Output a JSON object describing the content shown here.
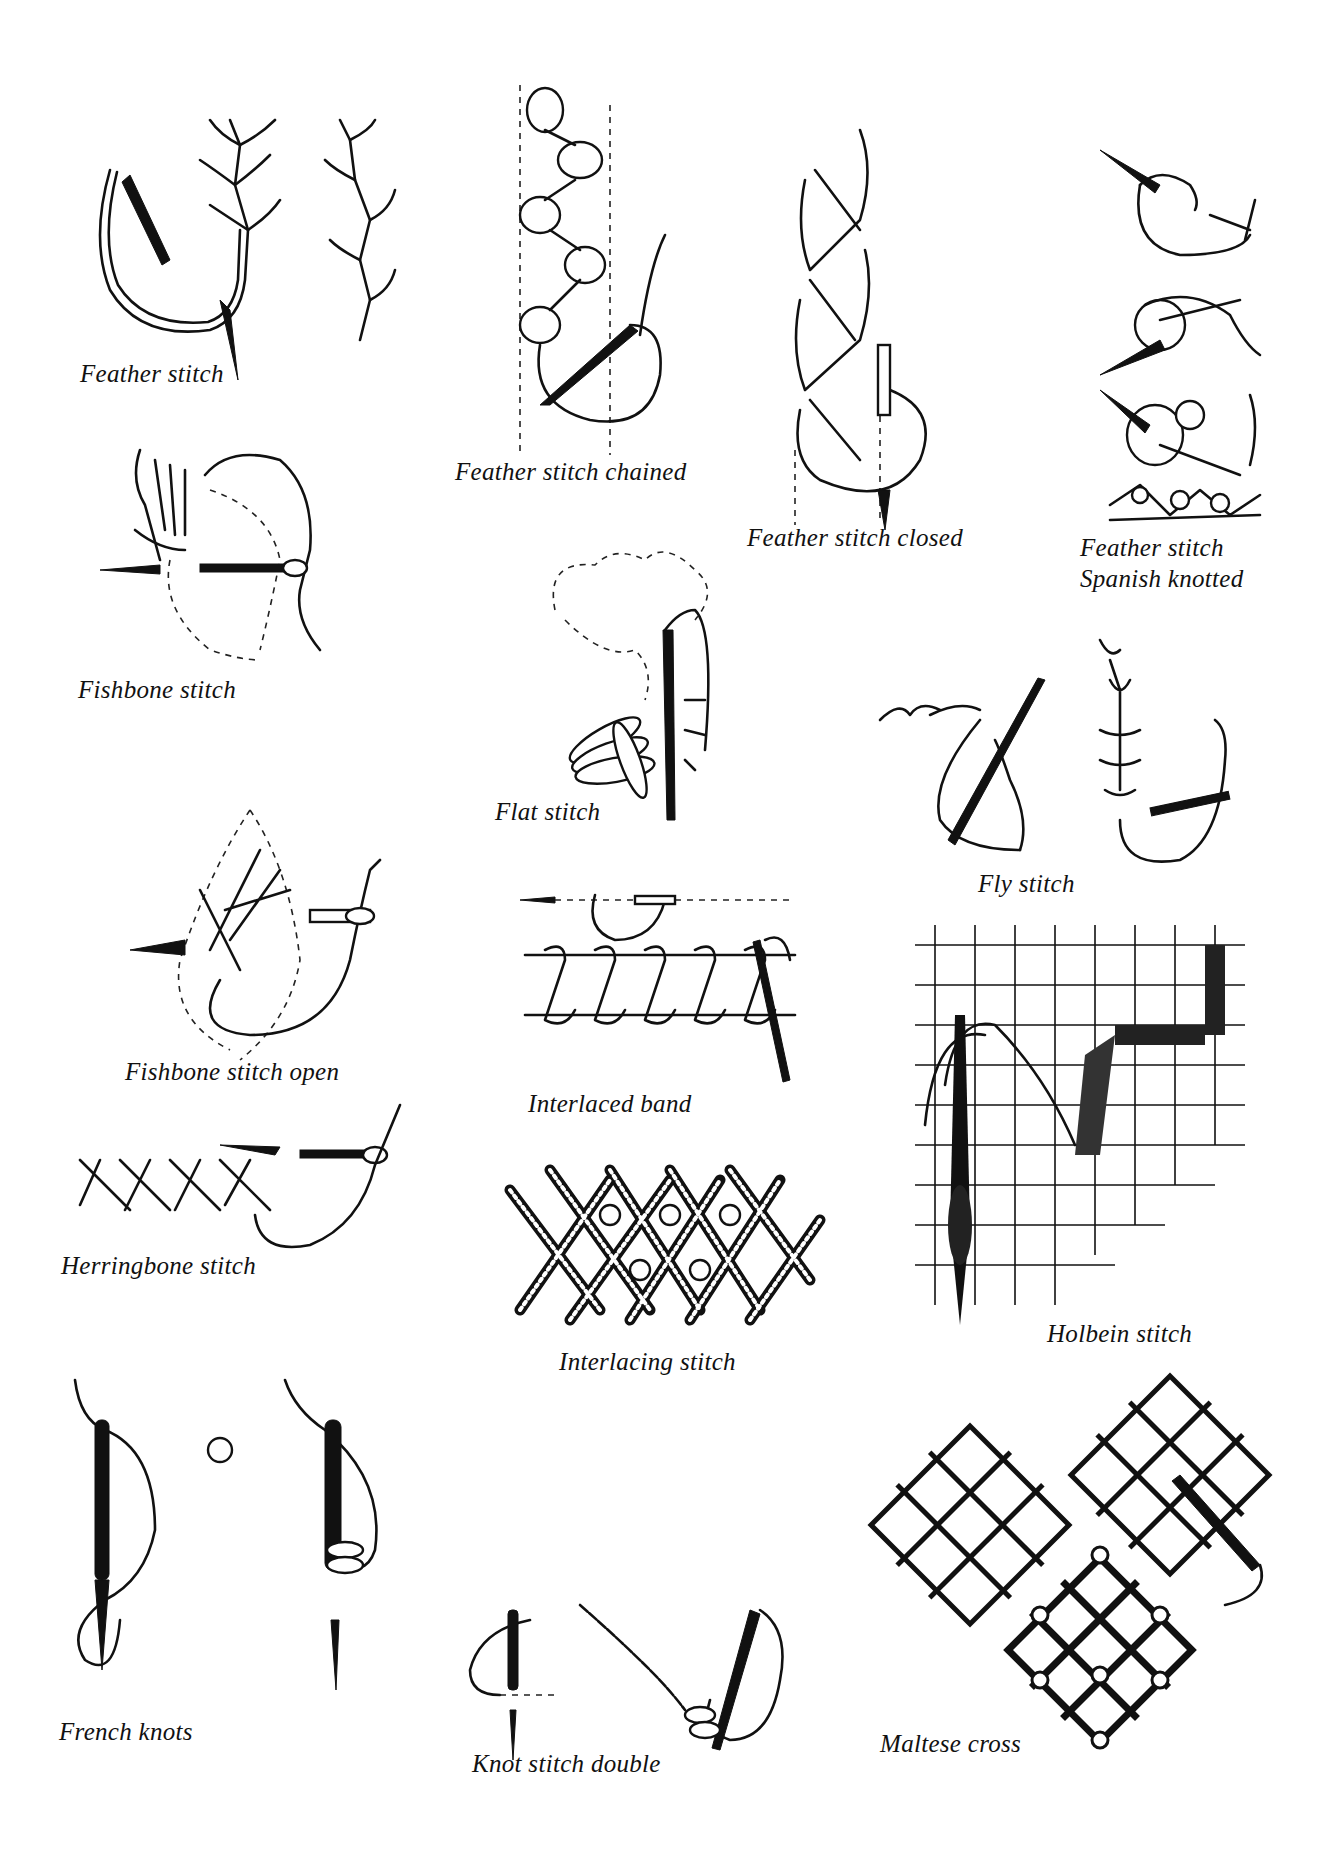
{
  "page": {
    "type": "embroidery stitch reference sheet",
    "background": "#ffffff",
    "ink_color": "#111111"
  },
  "stitches": [
    {
      "id": "feather-stitch",
      "label": "Feather stitch"
    },
    {
      "id": "feather-stitch-chained",
      "label": "Feather stitch chained"
    },
    {
      "id": "feather-stitch-closed",
      "label": "Feather stitch closed"
    },
    {
      "id": "feather-stitch-spanish-knotted",
      "label_line1": "Feather stitch",
      "label_line2": "Spanish knotted"
    },
    {
      "id": "fishbone-stitch",
      "label": "Fishbone stitch"
    },
    {
      "id": "flat-stitch",
      "label": "Flat stitch"
    },
    {
      "id": "fly-stitch",
      "label": "Fly stitch"
    },
    {
      "id": "fishbone-stitch-open",
      "label": "Fishbone stitch open"
    },
    {
      "id": "interlaced-band",
      "label": "Interlaced band"
    },
    {
      "id": "herringbone-stitch",
      "label": "Herringbone stitch"
    },
    {
      "id": "holbein-stitch",
      "label": "Holbein stitch"
    },
    {
      "id": "interlacing-stitch",
      "label": "Interlacing stitch"
    },
    {
      "id": "french-knots",
      "label": "French knots"
    },
    {
      "id": "knot-stitch-double",
      "label": "Knot stitch double"
    },
    {
      "id": "maltese-cross",
      "label": "Maltese cross"
    }
  ]
}
